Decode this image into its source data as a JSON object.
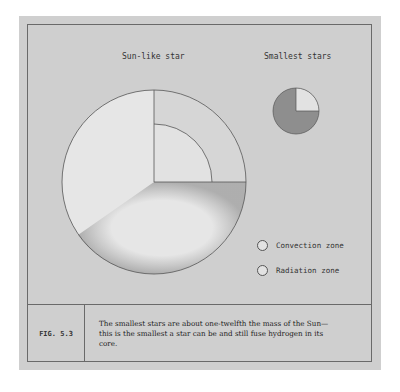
{
  "diagram": {
    "titles": {
      "sun_like": "Sun-like star",
      "smallest": "Smallest stars"
    },
    "legend": [
      {
        "label": "Convection zone"
      },
      {
        "label": "Radiation zone"
      }
    ],
    "caption": {
      "figure_label": "FIG. 5.3",
      "text": "The smallest stars are about one-twelfth the mass of the Sun—this is the smallest a star can be and still fuse hydrogen in its core."
    },
    "colors": {
      "panel": "#cfcfcf",
      "star_light": "#e6e6e6",
      "convection_dark": "#9a9a9a",
      "small_star": "#8c8c8c",
      "outline": "#555555"
    }
  }
}
